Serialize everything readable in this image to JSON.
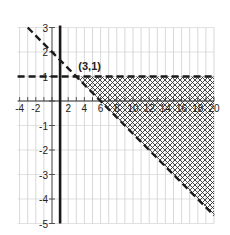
{
  "chart_data": {
    "type": "inequality-region",
    "title": "",
    "xlabel": "",
    "ylabel": "",
    "xlim": [
      -4,
      20
    ],
    "ylim": [
      -5,
      3
    ],
    "grid": true,
    "x_ticks": [
      -4,
      -2,
      2,
      4,
      6,
      8,
      10,
      12,
      14,
      16,
      18,
      20
    ],
    "x_tick_labels": [
      "-4",
      "-2",
      "2",
      "4",
      "6",
      "8",
      "10",
      "12",
      "14",
      "16",
      "18",
      "20"
    ],
    "y_ticks": [
      3,
      2,
      1,
      -1,
      -2,
      -3,
      -4,
      -5
    ],
    "y_tick_labels": [
      "3",
      "2",
      "1",
      "-1",
      "-2",
      "-3",
      "-4",
      "-5"
    ],
    "lines": [
      {
        "name": "horizontal-boundary",
        "equation": "y = 1",
        "style": "dashed",
        "color": "#222222"
      },
      {
        "name": "diagonal-boundary",
        "equation": "y = -x/3 + 2",
        "style": "dashed",
        "color": "#222222",
        "from": [
          -3,
          3
        ],
        "to": [
          20,
          -4.67
        ]
      },
      {
        "name": "vertical-line",
        "equation": "x = 1",
        "style": "solid-thick",
        "color": "#222222"
      }
    ],
    "shaded_region": {
      "description": "y < 1 and y > -x/3 + 2",
      "vertices": [
        [
          3,
          1
        ],
        [
          20,
          1
        ],
        [
          20,
          -4.67
        ]
      ],
      "pattern": "crosshatch"
    },
    "annotations": [
      {
        "text": "(3,1)",
        "x": 3,
        "y": 1
      }
    ]
  },
  "labels": {
    "point": "(3,1)"
  }
}
